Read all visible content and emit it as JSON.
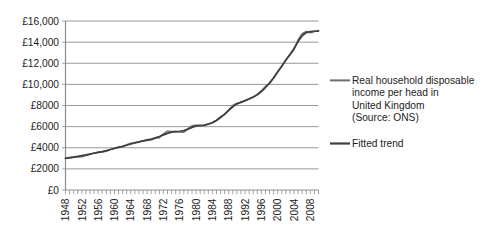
{
  "chart_data": {
    "type": "line",
    "title": "",
    "subtitle": "",
    "xlabel": "",
    "ylabel": "",
    "grid": "horizontal",
    "legend_position": "right",
    "xlim": [
      1948,
      2010
    ],
    "ylim": [
      0,
      16000
    ],
    "y_ticks": [
      0,
      2000,
      4000,
      6000,
      8000,
      10000,
      12000,
      14000,
      16000
    ],
    "y_tick_labels": [
      "£0",
      "£2000",
      "£4000",
      "£6000",
      "£8000",
      "£10,000",
      "£12,000",
      "£14,000",
      "£16,000"
    ],
    "x_ticks": [
      1948,
      1952,
      1956,
      1960,
      1964,
      1968,
      1972,
      1976,
      1980,
      1984,
      1988,
      1992,
      1996,
      2000,
      2004,
      2008
    ],
    "x_tick_labels": [
      "1948",
      "1952",
      "1956",
      "1960",
      "1964",
      "1968",
      "1972",
      "1976",
      "1980",
      "1984",
      "1988",
      "1992",
      "1996",
      "2000",
      "2004",
      "2008"
    ],
    "x_minor_tick_interval": 1,
    "x": [
      1948,
      1949,
      1950,
      1951,
      1952,
      1953,
      1954,
      1955,
      1956,
      1957,
      1958,
      1959,
      1960,
      1961,
      1962,
      1963,
      1964,
      1965,
      1966,
      1967,
      1968,
      1969,
      1970,
      1971,
      1972,
      1973,
      1974,
      1975,
      1976,
      1977,
      1978,
      1979,
      1980,
      1981,
      1982,
      1983,
      1984,
      1985,
      1986,
      1987,
      1988,
      1989,
      1990,
      1991,
      1992,
      1993,
      1994,
      1995,
      1996,
      1997,
      1998,
      1999,
      2000,
      2001,
      2002,
      2003,
      2004,
      2005,
      2006,
      2007,
      2008,
      2009,
      2010
    ],
    "series": [
      {
        "name": "Real household disposable income per head in United Kingdom (Source: ONS)",
        "color": "#6e6e6e",
        "values": [
          3000,
          3040,
          3110,
          3120,
          3150,
          3260,
          3390,
          3500,
          3560,
          3610,
          3680,
          3830,
          3960,
          4080,
          4120,
          4290,
          4430,
          4480,
          4560,
          4640,
          4700,
          4730,
          4900,
          4960,
          5320,
          5560,
          5540,
          5530,
          5490,
          5470,
          5800,
          6070,
          6120,
          6080,
          6100,
          6240,
          6390,
          6600,
          6950,
          7160,
          7600,
          8000,
          8220,
          8280,
          8460,
          8650,
          8800,
          9060,
          9400,
          9800,
          10100,
          10600,
          11200,
          11700,
          12300,
          12800,
          13300,
          14200,
          14800,
          15000,
          14900,
          15000,
          15100
        ]
      },
      {
        "name": "Fitted trend",
        "color": "#3f3f3f",
        "values": [
          3000,
          3060,
          3120,
          3180,
          3250,
          3320,
          3400,
          3480,
          3560,
          3640,
          3730,
          3830,
          3930,
          4030,
          4130,
          4240,
          4350,
          4460,
          4560,
          4650,
          4740,
          4830,
          4940,
          5070,
          5220,
          5360,
          5470,
          5530,
          5560,
          5620,
          5760,
          5930,
          6070,
          6120,
          6150,
          6230,
          6370,
          6580,
          6860,
          7180,
          7530,
          7880,
          8150,
          8320,
          8460,
          8620,
          8800,
          9020,
          9320,
          9700,
          10120,
          10620,
          11180,
          11740,
          12300,
          12840,
          13400,
          14050,
          14600,
          14900,
          15000,
          15030,
          15050
        ]
      }
    ],
    "legend_entries": [
      {
        "id": "observed",
        "lines": [
          "Real household disposable",
          "income per head in",
          "United Kingdom",
          "(Source: ONS)"
        ],
        "color": "#6e6e6e"
      },
      {
        "id": "trend",
        "lines": [
          "Fitted trend"
        ],
        "color": "#3f3f3f"
      }
    ]
  }
}
